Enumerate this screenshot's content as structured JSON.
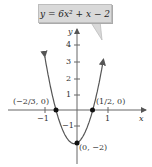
{
  "chart_data": {
    "type": "line",
    "title": "y = 6x² + x − 2",
    "equation": "y = 6x^2 + x - 2",
    "xlabel": "x",
    "ylabel": "y",
    "xlim": [
      -1.2,
      2.0
    ],
    "ylim": [
      -2.1,
      4.5
    ],
    "x_ticks": [
      -1,
      1
    ],
    "y_ticks": [
      -1,
      1,
      2,
      3,
      4
    ],
    "grid": false,
    "series": [
      {
        "name": "y = 6x^2 + x - 2",
        "function": "6x^2 + x - 2"
      }
    ],
    "points": [
      {
        "x": -0.6667,
        "y": 0,
        "label": "(−2/3, 0)"
      },
      {
        "x": 0.5,
        "y": 0,
        "label": "(1/2, 0)"
      },
      {
        "x": 0,
        "y": -2,
        "label": "(0, −2)"
      }
    ]
  },
  "callout": {
    "text": "y = 6x² + x − 2"
  },
  "axes": {
    "x_label": "x",
    "y_label": "y",
    "x_tick_labels": [
      "−1",
      "1"
    ],
    "y_tick_labels": [
      "4",
      "3",
      "2",
      "1",
      "−1"
    ]
  },
  "annotations": {
    "left_root": "(−2/3, 0)",
    "right_root": "(1/2, 0)",
    "y_intercept": "(0, −2)"
  }
}
